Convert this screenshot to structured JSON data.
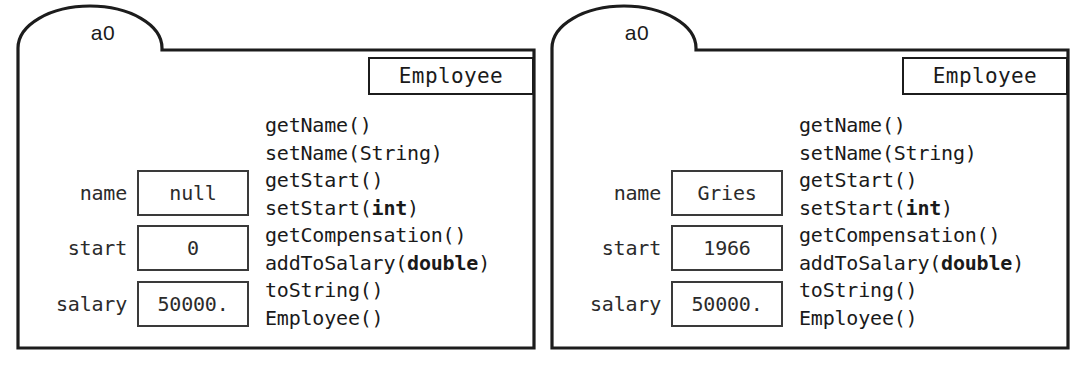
{
  "figure": {
    "kind": "uml-object-diagram",
    "background_color": "#ffffff",
    "line_color": "#1c1c1c",
    "text_color": "#1a1a1a"
  },
  "panels": [
    {
      "instance_name": "a0",
      "class_name": "Employee",
      "fields": [
        {
          "label": "name",
          "value": "null"
        },
        {
          "label": "start",
          "value": "0"
        },
        {
          "label": "salary",
          "value": "50000."
        }
      ],
      "methods": [
        {
          "text": "getName()",
          "prefix": "getName()",
          "bold": "",
          "suffix": ""
        },
        {
          "text": "setName(String)",
          "prefix": "setName(String)",
          "bold": "",
          "suffix": ""
        },
        {
          "text": "getStart()",
          "prefix": "getStart()",
          "bold": "",
          "suffix": ""
        },
        {
          "text": "setStart(int)",
          "prefix": "setStart(",
          "bold": "int",
          "suffix": ")"
        },
        {
          "text": "getCompensation()",
          "prefix": "getCompensation()",
          "bold": "",
          "suffix": ""
        },
        {
          "text": "addToSalary(double)",
          "prefix": "addToSalary(",
          "bold": "double",
          "suffix": ")"
        },
        {
          "text": "toString()",
          "prefix": "toString()",
          "bold": "",
          "suffix": ""
        },
        {
          "text": "Employee()",
          "prefix": "Employee()",
          "bold": "",
          "suffix": ""
        }
      ]
    },
    {
      "instance_name": "a0",
      "class_name": "Employee",
      "fields": [
        {
          "label": "name",
          "value": "Gries"
        },
        {
          "label": "start",
          "value": "1966"
        },
        {
          "label": "salary",
          "value": "50000."
        }
      ],
      "methods": [
        {
          "text": "getName()",
          "prefix": "getName()",
          "bold": "",
          "suffix": ""
        },
        {
          "text": "setName(String)",
          "prefix": "setName(String)",
          "bold": "",
          "suffix": ""
        },
        {
          "text": "getStart()",
          "prefix": "getStart()",
          "bold": "",
          "suffix": ""
        },
        {
          "text": "setStart(int)",
          "prefix": "setStart(",
          "bold": "int",
          "suffix": ")"
        },
        {
          "text": "getCompensation()",
          "prefix": "getCompensation()",
          "bold": "",
          "suffix": ""
        },
        {
          "text": "addToSalary(double)",
          "prefix": "addToSalary(",
          "bold": "double",
          "suffix": ")"
        },
        {
          "text": "toString()",
          "prefix": "toString()",
          "bold": "",
          "suffix": ""
        },
        {
          "text": "Employee()",
          "prefix": "Employee()",
          "bold": "",
          "suffix": ""
        }
      ]
    }
  ]
}
